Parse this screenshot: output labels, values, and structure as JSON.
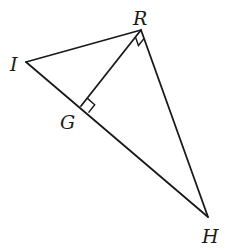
{
  "diagram": {
    "type": "geometry",
    "stroke_color": "#1a1a1a",
    "points": {
      "I": {
        "label": "I",
        "x": 26,
        "y": 62
      },
      "R": {
        "label": "R",
        "x": 141,
        "y": 30
      },
      "G": {
        "label": "G",
        "x": 81,
        "y": 106
      },
      "H": {
        "label": "H",
        "x": 208,
        "y": 217
      }
    },
    "labels": {
      "R": {
        "text": "R",
        "x": 133,
        "y": 25
      },
      "I": {
        "text": "I",
        "x": 10,
        "y": 71
      },
      "G": {
        "text": "G",
        "x": 60,
        "y": 129
      },
      "H": {
        "text": "H",
        "x": 202,
        "y": 243
      }
    },
    "segments": [
      {
        "name": "segment-IR",
        "from": "I",
        "to": "R"
      },
      {
        "name": "segment-RH",
        "from": "R",
        "to": "H"
      },
      {
        "name": "segment-IH",
        "from": "I",
        "to": "H"
      },
      {
        "name": "segment-RG",
        "from": "R",
        "to": "G"
      }
    ],
    "right_angle_marks": [
      "R",
      "G"
    ]
  }
}
